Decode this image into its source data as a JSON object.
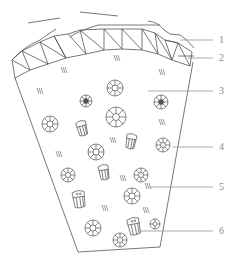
{
  "diagram": {
    "type": "cross-section schematic",
    "stroke_color": "#555555",
    "label_color": "#8a8a8a",
    "labels": [
      {
        "id": "1",
        "text": "1",
        "y": 40,
        "line_from_x": 180
      },
      {
        "id": "2",
        "text": "2",
        "y": 58,
        "line_from_x": 188
      },
      {
        "id": "3",
        "text": "3",
        "y": 91,
        "line_from_x": 148
      },
      {
        "id": "4",
        "text": "4",
        "y": 147,
        "line_from_x": 172
      },
      {
        "id": "5",
        "text": "5",
        "y": 187,
        "line_from_x": 150
      },
      {
        "id": "6",
        "text": "6",
        "y": 231,
        "line_from_x": 140
      }
    ],
    "symbols": {
      "round_grains": [
        {
          "x": 115,
          "y": 88,
          "r": 8
        },
        {
          "x": 86,
          "y": 101,
          "r": 6
        },
        {
          "x": 161,
          "y": 102,
          "r": 7
        },
        {
          "x": 116,
          "y": 117,
          "r": 10
        },
        {
          "x": 50,
          "y": 124,
          "r": 8
        },
        {
          "x": 163,
          "y": 145,
          "r": 7
        },
        {
          "x": 96,
          "y": 152,
          "r": 8
        },
        {
          "x": 68,
          "y": 175,
          "r": 7
        },
        {
          "x": 141,
          "y": 175,
          "r": 7
        },
        {
          "x": 132,
          "y": 196,
          "r": 8
        },
        {
          "x": 93,
          "y": 228,
          "r": 8
        },
        {
          "x": 155,
          "y": 224,
          "r": 5
        },
        {
          "x": 120,
          "y": 240,
          "r": 7
        }
      ],
      "shell_grains": [
        {
          "x": 82,
          "y": 128
        },
        {
          "x": 131,
          "y": 141
        },
        {
          "x": 104,
          "y": 172
        },
        {
          "x": 79,
          "y": 199
        },
        {
          "x": 134,
          "y": 226
        }
      ],
      "hatch_marks": [
        {
          "x": 117,
          "y": 58
        },
        {
          "x": 64,
          "y": 70
        },
        {
          "x": 162,
          "y": 72
        },
        {
          "x": 40,
          "y": 91
        },
        {
          "x": 162,
          "y": 122
        },
        {
          "x": 113,
          "y": 140
        },
        {
          "x": 59,
          "y": 154
        },
        {
          "x": 123,
          "y": 178
        },
        {
          "x": 148,
          "y": 186
        },
        {
          "x": 105,
          "y": 208
        },
        {
          "x": 146,
          "y": 210
        }
      ]
    }
  }
}
